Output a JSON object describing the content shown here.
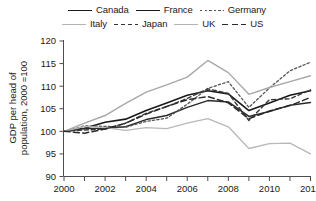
{
  "chart_data": {
    "type": "line",
    "title": "",
    "xlabel": "",
    "ylabel": "GDP per head of population, 2000 =100",
    "ylabel_line1": "GDP per head of",
    "ylabel_line2": "population, 2000 =100",
    "ylim": [
      90,
      120
    ],
    "xlim": [
      2000,
      2012
    ],
    "yticks": [
      90,
      95,
      100,
      105,
      110,
      115,
      120
    ],
    "ytick_labels": [
      "90",
      "95",
      "100",
      "105",
      "110",
      "115",
      "120"
    ],
    "xticks": [
      2000,
      2001,
      2002,
      2003,
      2004,
      2005,
      2006,
      2007,
      2008,
      2009,
      2010,
      2011,
      2012
    ],
    "xtick_labels": [
      "2000",
      "",
      "2002",
      "",
      "2004",
      "",
      "2006",
      "",
      "2008",
      "",
      "2010",
      "",
      "2012"
    ],
    "xtick_labels_shown": [
      "2000",
      "2002",
      "2004",
      "2006",
      "2008",
      "2010",
      "2012"
    ],
    "grid": false,
    "legend_position": "top",
    "x": [
      2000,
      2001,
      2002,
      2003,
      2004,
      2005,
      2006,
      2007,
      2008,
      2009,
      2010,
      2011,
      2012
    ],
    "series": [
      {
        "name": "Canada",
        "style": "solid",
        "color": "#1a1a1a",
        "width": 1.6,
        "values": [
          100,
          100.7,
          102.0,
          102.7,
          104.6,
          106.3,
          108.0,
          109.0,
          108.3,
          104.6,
          106.3,
          108.0,
          109.0
        ]
      },
      {
        "name": "France",
        "style": "solid",
        "color": "#2b2b2b",
        "width": 1.5,
        "values": [
          100,
          100.6,
          100.7,
          101.0,
          102.6,
          103.5,
          105.3,
          106.8,
          106.5,
          103.3,
          104.4,
          105.8,
          106.4
        ]
      },
      {
        "name": "Germany",
        "style": "dotted",
        "color": "#555555",
        "width": 1.3,
        "values": [
          100,
          101.2,
          101.1,
          100.9,
          102.2,
          102.9,
          106.0,
          109.5,
          111.0,
          105.3,
          109.6,
          113.4,
          115.3
        ]
      },
      {
        "name": "Italy",
        "style": "solid",
        "color": "#b8b8b8",
        "width": 1.3,
        "values": [
          100,
          101.1,
          100.8,
          100.2,
          100.8,
          100.6,
          101.8,
          102.8,
          101.0,
          96.2,
          97.3,
          97.4,
          95.0
        ]
      },
      {
        "name": "Japan",
        "style": "dashed",
        "color": "#3a3a3a",
        "width": 1.4,
        "values": [
          100,
          100.3,
          100.5,
          101.8,
          104.0,
          105.5,
          107.3,
          109.4,
          108.4,
          102.4,
          107.0,
          107.2,
          109.2
        ]
      },
      {
        "name": "UK",
        "style": "solid",
        "color": "#a8a8a8",
        "width": 1.4,
        "values": [
          100,
          101.8,
          103.5,
          106.2,
          108.7,
          110.3,
          112.0,
          115.7,
          113.0,
          108.2,
          109.7,
          111.0,
          112.3
        ]
      },
      {
        "name": "US",
        "style": "longdash",
        "color": "#2a2a2a",
        "width": 1.5,
        "values": [
          100,
          99.6,
          100.5,
          101.8,
          103.8,
          105.5,
          107.0,
          107.7,
          106.3,
          102.8,
          104.5,
          105.7,
          107.5
        ]
      }
    ]
  },
  "legend": {
    "row1": [
      {
        "label": "Canada",
        "style": "solid-dark"
      },
      {
        "label": "France",
        "style": "solid-dark"
      },
      {
        "label": "Germany",
        "style": "dotted"
      }
    ],
    "row2": [
      {
        "label": "Italy",
        "style": "solid-light"
      },
      {
        "label": "Japan",
        "style": "dashed"
      },
      {
        "label": "UK",
        "style": "solid-light"
      },
      {
        "label": "US",
        "style": "longdash"
      }
    ]
  },
  "axis": {
    "y_label_line1": "GDP per head of",
    "y_label_line2": "population, 2000 =100",
    "y_ticks": [
      "120",
      "115",
      "110",
      "105",
      "100",
      "95",
      "90"
    ],
    "x_ticks": [
      "2000",
      "2002",
      "2004",
      "2006",
      "2008",
      "2010",
      "2012"
    ]
  },
  "colors": {
    "axis": "#4d4d4d",
    "text": "#1a1a1a",
    "dark_line": "#1a1a1a",
    "light_line": "#b3b3b3",
    "background": "#ffffff"
  }
}
